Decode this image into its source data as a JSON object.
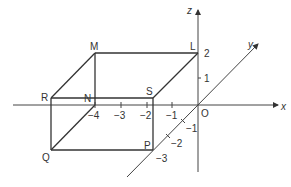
{
  "diagram": {
    "axes": {
      "x_label": "x",
      "y_label": "y",
      "z_label": "z",
      "origin_label": "O"
    },
    "points": {
      "M": "M",
      "L": "L",
      "R": "R",
      "N": "N",
      "S": "S",
      "Q": "Q",
      "P": "P"
    },
    "x_ticks": [
      "−4",
      "−3",
      "−2",
      "−1"
    ],
    "y_ticks": [
      "−1",
      "−2",
      "−3"
    ],
    "z_ticks": [
      "1",
      "2"
    ],
    "colors": {
      "line": "#333333",
      "axis": "#555555",
      "background": "#ffffff"
    }
  }
}
